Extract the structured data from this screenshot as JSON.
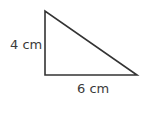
{
  "figure": {
    "shape": "right-triangle",
    "stroke_color": "#333333",
    "vertices": {
      "top": [
        45,
        11
      ],
      "right_angle": [
        45,
        75
      ],
      "right": [
        137,
        75
      ]
    },
    "labels": {
      "height": "4 cm",
      "base": "6 cm"
    }
  }
}
